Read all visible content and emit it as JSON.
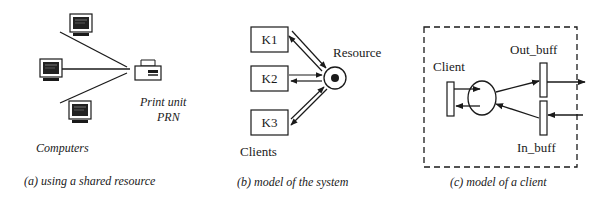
{
  "panels": {
    "a": {
      "caption": "(a) using a shared resource",
      "computers_label": "Computers",
      "printer_label_line1": "Print unit",
      "printer_label_line2": "PRN",
      "computer_icon": "computer-monitor-icon",
      "printer_icon": "printer-icon"
    },
    "b": {
      "caption": "(b) model of the system",
      "clients": [
        "K1",
        "K2",
        "K3"
      ],
      "clients_label": "Clients",
      "resource_label": "Resource"
    },
    "c": {
      "caption": "(c) model of a client",
      "client_label": "Client",
      "out_buff_label": "Out_buff",
      "in_buff_label": "In_buff"
    }
  },
  "colors": {
    "ink": "#1a1a1a",
    "background": "#ffffff",
    "bleed_through": "#ececec"
  }
}
